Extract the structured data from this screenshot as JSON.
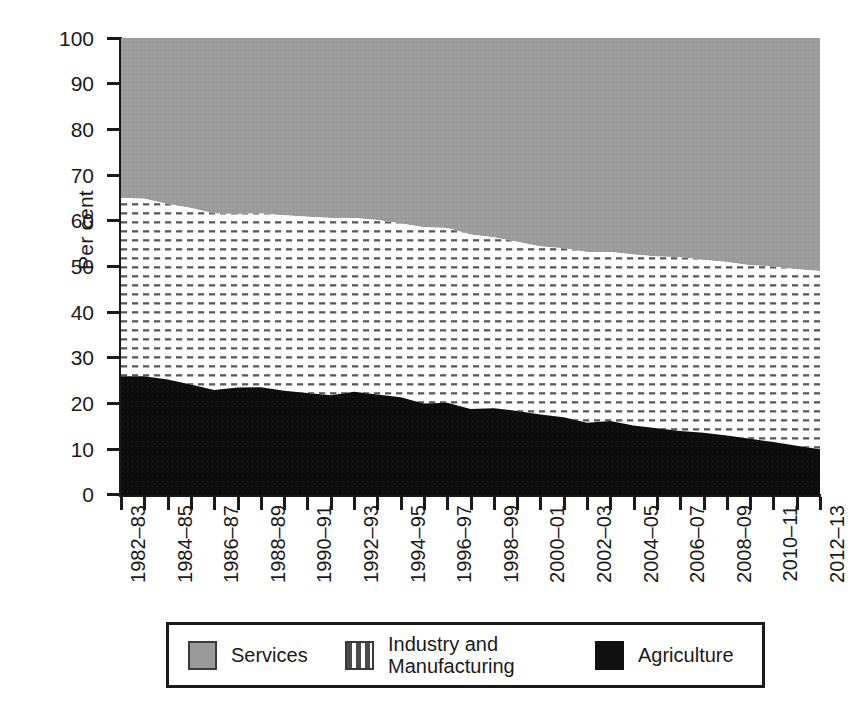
{
  "chart_data": {
    "type": "area",
    "stacked": true,
    "title": "",
    "subtitle": "",
    "xlabel": "",
    "ylabel": "Per cent",
    "ylim": [
      0,
      100
    ],
    "ytick_values": [
      0,
      10,
      20,
      30,
      40,
      50,
      60,
      70,
      80,
      90,
      100
    ],
    "ytick_labels": [
      "0",
      "10",
      "20",
      "30",
      "40",
      "50",
      "60",
      "70",
      "80",
      "90",
      "100"
    ],
    "grid": false,
    "legend_position": "below-plot",
    "x": [
      "1982-83",
      "1983-84",
      "1984-85",
      "1985-86",
      "1986-87",
      "1987-88",
      "1988-89",
      "1989-90",
      "1990-91",
      "1991-92",
      "1992-93",
      "1993-94",
      "1994-95",
      "1995-96",
      "1996-97",
      "1997-98",
      "1998-99",
      "1999-2000",
      "2000-01",
      "2001-02",
      "2002-03",
      "2003-04",
      "2004-05",
      "2005-06",
      "2006-07",
      "2007-08",
      "2008-09",
      "2009-10",
      "2010-11",
      "2011-12",
      "2012-13"
    ],
    "xtick_labels": [
      "1982–83",
      "1984–85",
      "1986–87",
      "1988–89",
      "1990–91",
      "1992–93",
      "1994–95",
      "1996–97",
      "1998–99",
      "2000–01",
      "2002–03",
      "2004–05",
      "2006–07",
      "2008–09",
      "2010–11",
      "2012–13"
    ],
    "xtick_label_every": 2,
    "series": [
      {
        "name": "Agriculture",
        "color": "#111111",
        "pattern": "solid",
        "values": [
          26.0,
          26.0,
          25.3,
          24.2,
          23.0,
          23.5,
          23.6,
          22.8,
          22.3,
          21.8,
          22.6,
          22.0,
          21.4,
          20.0,
          20.2,
          18.8,
          19.0,
          18.4,
          17.6,
          17.0,
          15.8,
          16.2,
          15.2,
          14.6,
          14.0,
          13.6,
          13.0,
          12.3,
          11.6,
          10.8,
          10.0
        ]
      },
      {
        "name": "Industry and Manufacturing",
        "color": "#ffffff",
        "pattern": "dashed-horizontal",
        "values": [
          39.0,
          38.8,
          38.4,
          38.6,
          38.6,
          38.0,
          38.0,
          38.4,
          38.6,
          38.8,
          38.0,
          38.2,
          38.0,
          38.6,
          38.2,
          38.2,
          37.4,
          37.0,
          36.8,
          37.0,
          37.4,
          37.0,
          37.4,
          37.6,
          38.0,
          37.8,
          38.0,
          38.0,
          38.4,
          38.6,
          39.0
        ]
      },
      {
        "name": "Services",
        "color": "#9a9a9a",
        "pattern": "solid",
        "values": [
          35.0,
          35.2,
          36.3,
          37.2,
          38.4,
          38.5,
          38.4,
          38.8,
          39.1,
          39.4,
          39.4,
          39.8,
          40.6,
          41.4,
          41.6,
          43.0,
          43.6,
          44.6,
          45.6,
          46.0,
          46.8,
          46.8,
          47.4,
          47.8,
          48.0,
          48.6,
          49.0,
          49.7,
          50.0,
          50.6,
          51.0
        ]
      }
    ],
    "cumulative_boundaries": {
      "agriculture_top": [
        26.0,
        26.0,
        25.3,
        24.2,
        23.0,
        23.5,
        23.6,
        22.8,
        22.3,
        21.8,
        22.6,
        22.0,
        21.4,
        20.0,
        20.2,
        18.8,
        19.0,
        18.4,
        17.6,
        17.0,
        15.8,
        16.2,
        15.2,
        14.6,
        14.0,
        13.6,
        13.0,
        12.3,
        11.6,
        10.8,
        10.0
      ],
      "industry_top": [
        65.0,
        64.8,
        63.7,
        62.8,
        61.6,
        61.5,
        61.6,
        61.2,
        60.9,
        60.6,
        60.6,
        60.2,
        59.4,
        58.6,
        58.4,
        57.0,
        56.4,
        55.4,
        54.4,
        54.0,
        53.2,
        53.2,
        52.6,
        52.2,
        52.0,
        51.4,
        51.0,
        50.3,
        50.0,
        49.4,
        49.0
      ]
    }
  },
  "axis": {
    "y_label": "Per cent",
    "y_ticks": [
      "100",
      "90",
      "80",
      "70",
      "60",
      "50",
      "40",
      "30",
      "20",
      "10",
      "0"
    ],
    "x_ticks": [
      "1982–83",
      "1984–85",
      "1986–87",
      "1988–89",
      "1990–91",
      "1992–93",
      "1994–95",
      "1996–97",
      "1998–99",
      "2000–01",
      "2002–03",
      "2004–05",
      "2006–07",
      "2008–09",
      "2010–11",
      "2012–13"
    ]
  },
  "legend": {
    "items": [
      {
        "label": "Services",
        "swatch": "services",
        "color": "#9a9a9a"
      },
      {
        "label": "Industry and\nManufacturing",
        "label_line1": "Industry and",
        "label_line2": "Manufacturing",
        "swatch": "industry",
        "color": "#ffffff"
      },
      {
        "label": "Agriculture",
        "swatch": "agriculture",
        "color": "#111111"
      }
    ]
  },
  "caption": {
    "text": ""
  },
  "colors": {
    "services": "#9a9a9a",
    "industry": "#ffffff",
    "agriculture": "#111111",
    "axis": "#1a1a1a",
    "background": "#ffffff"
  }
}
